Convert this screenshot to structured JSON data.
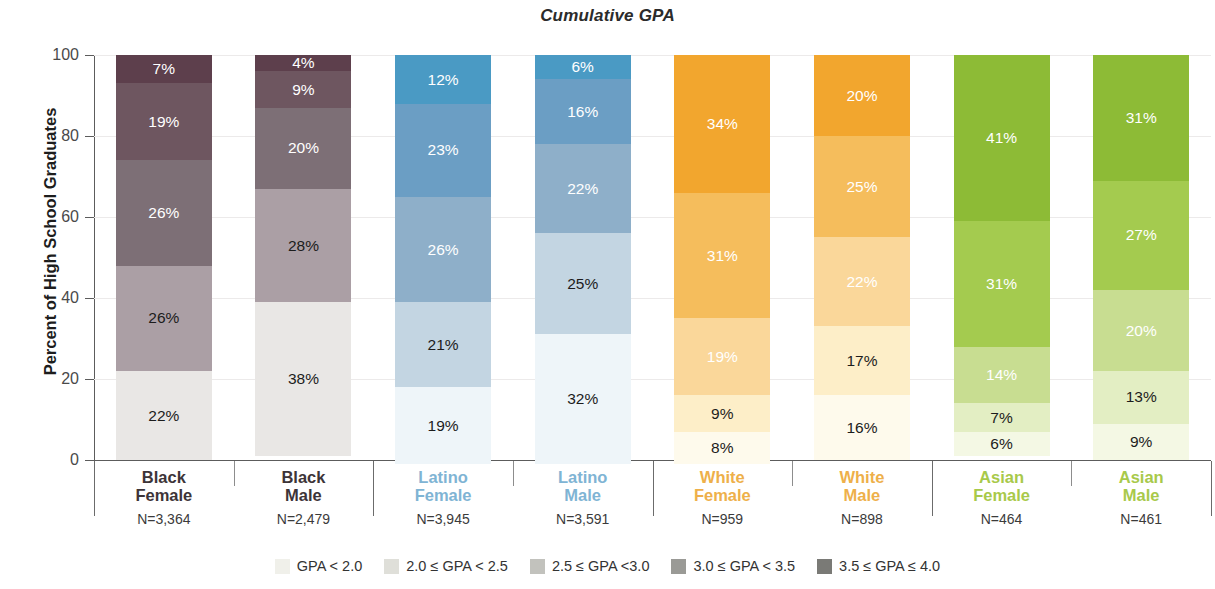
{
  "chart_data": {
    "type": "bar",
    "subtype": "stacked-bar-100-percent",
    "title": "Cumulative GPA",
    "xlabel": "",
    "ylabel": "Percent of High School Graduates",
    "ylim": [
      0,
      100
    ],
    "yticks": [
      0,
      20,
      40,
      60,
      80,
      100
    ],
    "grid": true,
    "legend_position": "bottom",
    "categories": [
      "Black Female",
      "Black Male",
      "Latino Female",
      "Latino Male",
      "White Female",
      "White Male",
      "Asian Female",
      "Asian Male"
    ],
    "series": [
      {
        "name": "GPA < 2.0",
        "values": [
          22,
          38,
          19,
          32,
          8,
          16,
          6,
          9
        ]
      },
      {
        "name": "2.0 ≤ GPA < 2.5",
        "values": [
          26,
          28,
          21,
          25,
          9,
          17,
          7,
          13
        ]
      },
      {
        "name": "2.5 ≤ GPA <3.0",
        "values": [
          26,
          20,
          26,
          22,
          19,
          22,
          14,
          20
        ]
      },
      {
        "name": "3.0 ≤ GPA < 3.5",
        "values": [
          19,
          9,
          23,
          16,
          31,
          25,
          31,
          27
        ]
      },
      {
        "name": "3.5 ≤ GPA ≤ 4.0",
        "values": [
          7,
          4,
          12,
          6,
          34,
          20,
          41,
          31
        ]
      }
    ]
  },
  "title": "Cumulative GPA",
  "y_axis": {
    "label": "Percent of High School Graduates",
    "ticks": [
      "100",
      "80",
      "60",
      "40",
      "20",
      "0"
    ]
  },
  "legend": {
    "items": [
      {
        "label": "GPA < 2.0",
        "color": "#f0f0ea"
      },
      {
        "label": "2.0 ≤ GPA < 2.5",
        "color": "#dfdfd9"
      },
      {
        "label": "2.5 ≤ GPA <3.0",
        "color": "#c2c2bd"
      },
      {
        "label": "3.0 ≤ GPA < 3.5",
        "color": "#9a9a96"
      },
      {
        "label": "3.5 ≤ GPA ≤ 4.0",
        "color": "#7a7a76"
      }
    ]
  },
  "groups": [
    {
      "key": "black-female",
      "name": "Black\nFemale",
      "n": "N=3,364",
      "name_color": "#3d3438",
      "segments": [
        {
          "label": "7%",
          "value": 7,
          "color": "#5d3f4c",
          "text_color": "#ffffff"
        },
        {
          "label": "19%",
          "value": 19,
          "color": "#6e5660",
          "text_color": "#ffffff"
        },
        {
          "label": "26%",
          "value": 26,
          "color": "#7d6f76",
          "text_color": "#ffffff"
        },
        {
          "label": "26%",
          "value": 26,
          "color": "#ab9fa5",
          "text_color": "#1c1c1c"
        },
        {
          "label": "22%",
          "value": 22,
          "color": "#e9e7e5",
          "text_color": "#1c1c1c"
        }
      ]
    },
    {
      "key": "black-male",
      "name": "Black\nMale",
      "n": "N=2,479",
      "name_color": "#3d3438",
      "segments": [
        {
          "label": "4%",
          "value": 4,
          "color": "#5d3f4c",
          "text_color": "#ffffff"
        },
        {
          "label": "9%",
          "value": 9,
          "color": "#6e5660",
          "text_color": "#ffffff"
        },
        {
          "label": "20%",
          "value": 20,
          "color": "#7d6f76",
          "text_color": "#ffffff"
        },
        {
          "label": "28%",
          "value": 28,
          "color": "#ab9fa5",
          "text_color": "#1c1c1c"
        },
        {
          "label": "38%",
          "value": 38,
          "color": "#e9e7e5",
          "text_color": "#1c1c1c"
        }
      ]
    },
    {
      "key": "latino-female",
      "name": "Latino\nFemale",
      "n": "N=3,945",
      "name_color": "#7fb4d4",
      "segments": [
        {
          "label": "12%",
          "value": 12,
          "color": "#4a9ac4",
          "text_color": "#ffffff"
        },
        {
          "label": "23%",
          "value": 23,
          "color": "#6b9ec4",
          "text_color": "#ffffff"
        },
        {
          "label": "26%",
          "value": 26,
          "color": "#8eafc9",
          "text_color": "#ffffff"
        },
        {
          "label": "21%",
          "value": 21,
          "color": "#c3d5e2",
          "text_color": "#1c1c1c"
        },
        {
          "label": "19%",
          "value": 19,
          "color": "#eef5f9",
          "text_color": "#1c1c1c"
        }
      ]
    },
    {
      "key": "latino-male",
      "name": "Latino\nMale",
      "n": "N=3,591",
      "name_color": "#7fb4d4",
      "segments": [
        {
          "label": "6%",
          "value": 6,
          "color": "#4a9ac4",
          "text_color": "#ffffff"
        },
        {
          "label": "16%",
          "value": 16,
          "color": "#6b9ec4",
          "text_color": "#ffffff"
        },
        {
          "label": "22%",
          "value": 22,
          "color": "#8eafc9",
          "text_color": "#ffffff"
        },
        {
          "label": "25%",
          "value": 25,
          "color": "#c3d5e2",
          "text_color": "#1c1c1c"
        },
        {
          "label": "32%",
          "value": 32,
          "color": "#eef5f9",
          "text_color": "#1c1c1c"
        }
      ]
    },
    {
      "key": "white-female",
      "name": "White\nFemale",
      "n": "N=959",
      "name_color": "#eeb04a",
      "segments": [
        {
          "label": "34%",
          "value": 34,
          "color": "#f2a62e",
          "text_color": "#ffffff"
        },
        {
          "label": "31%",
          "value": 31,
          "color": "#f5bd5c",
          "text_color": "#ffffff"
        },
        {
          "label": "19%",
          "value": 19,
          "color": "#fad79a",
          "text_color": "#ffffff"
        },
        {
          "label": "9%",
          "value": 9,
          "color": "#fdeec8",
          "text_color": "#1c1c1c"
        },
        {
          "label": "8%",
          "value": 8,
          "color": "#fefaec",
          "text_color": "#1c1c1c"
        }
      ]
    },
    {
      "key": "white-male",
      "name": "White\nMale",
      "n": "N=898",
      "name_color": "#eeb04a",
      "segments": [
        {
          "label": "20%",
          "value": 20,
          "color": "#f2a62e",
          "text_color": "#ffffff"
        },
        {
          "label": "25%",
          "value": 25,
          "color": "#f5bd5c",
          "text_color": "#ffffff"
        },
        {
          "label": "22%",
          "value": 22,
          "color": "#fad79a",
          "text_color": "#ffffff"
        },
        {
          "label": "17%",
          "value": 17,
          "color": "#fdeec8",
          "text_color": "#1c1c1c"
        },
        {
          "label": "16%",
          "value": 16,
          "color": "#fefaec",
          "text_color": "#1c1c1c"
        }
      ]
    },
    {
      "key": "asian-female",
      "name": "Asian\nFemale",
      "n": "N=464",
      "name_color": "#a8c94a",
      "segments": [
        {
          "label": "41%",
          "value": 41,
          "color": "#8dbb36",
          "text_color": "#ffffff"
        },
        {
          "label": "31%",
          "value": 31,
          "color": "#a4cb4f",
          "text_color": "#ffffff"
        },
        {
          "label": "14%",
          "value": 14,
          "color": "#c8dd91",
          "text_color": "#ffffff"
        },
        {
          "label": "7%",
          "value": 7,
          "color": "#e3eec3",
          "text_color": "#1c1c1c"
        },
        {
          "label": "6%",
          "value": 6,
          "color": "#f4f8e4",
          "text_color": "#1c1c1c"
        }
      ]
    },
    {
      "key": "asian-male",
      "name": "Asian\nMale",
      "n": "N=461",
      "name_color": "#a8c94a",
      "segments": [
        {
          "label": "31%",
          "value": 31,
          "color": "#8dbb36",
          "text_color": "#ffffff"
        },
        {
          "label": "27%",
          "value": 27,
          "color": "#a4cb4f",
          "text_color": "#ffffff"
        },
        {
          "label": "20%",
          "value": 20,
          "color": "#c8dd91",
          "text_color": "#ffffff"
        },
        {
          "label": "13%",
          "value": 13,
          "color": "#e3eec3",
          "text_color": "#1c1c1c"
        },
        {
          "label": "9%",
          "value": 9,
          "color": "#f4f8e4",
          "text_color": "#1c1c1c"
        }
      ]
    }
  ]
}
